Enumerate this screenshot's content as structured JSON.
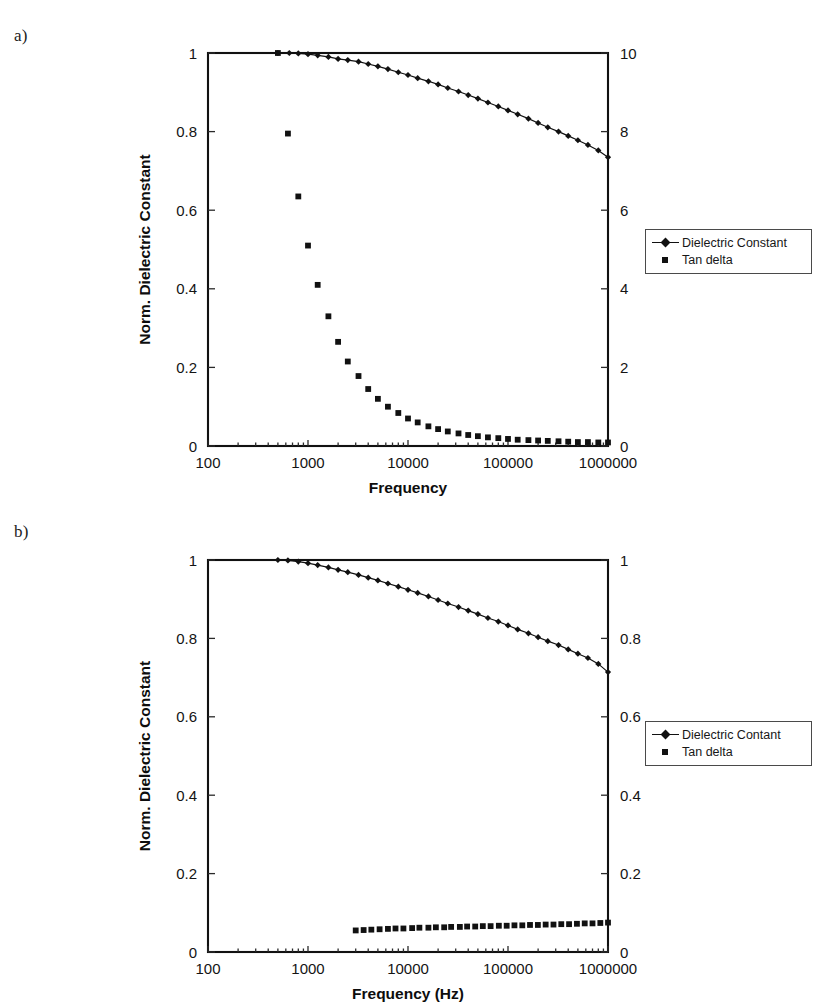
{
  "figure": {
    "panels": [
      {
        "id": "a",
        "label": "a)",
        "left_axis_title": "Norm. Dielectric Constant",
        "x_axis_title": "Frequency",
        "left_ticks": [
          "0",
          "0.2",
          "0.4",
          "0.6",
          "0.8",
          "1"
        ],
        "right_ticks": [
          "0",
          "2",
          "4",
          "6",
          "8",
          "10"
        ],
        "x_ticks": [
          "100",
          "1000",
          "10000",
          "100000",
          "1000000"
        ],
        "legend": [
          {
            "label": "Dielectric Constant",
            "marker": "diamond-line-icon"
          },
          {
            "label": "Tan delta",
            "marker": "square-icon"
          }
        ]
      },
      {
        "id": "b",
        "label": "b)",
        "left_axis_title": "Norm. Dielectric Constant",
        "x_axis_title": "Frequency (Hz)",
        "left_ticks": [
          "0",
          "0.2",
          "0.4",
          "0.6",
          "0.8",
          "1"
        ],
        "right_ticks": [
          "0",
          "0.2",
          "0.4",
          "0.6",
          "0.8",
          "1"
        ],
        "x_ticks": [
          "100",
          "1000",
          "10000",
          "100000",
          "1000000"
        ],
        "legend": [
          {
            "label": "Dielectric Contant",
            "marker": "diamond-line-icon"
          },
          {
            "label": "Tan delta",
            "marker": "square-icon"
          }
        ]
      }
    ]
  },
  "chart_data": [
    {
      "type": "line",
      "panel": "a",
      "title": "",
      "xlabel": "Frequency",
      "ylabel": "Norm. Dielectric Constant",
      "y2label": "",
      "xscale": "log",
      "xlim": [
        100,
        1000000
      ],
      "ylim": [
        0,
        1
      ],
      "y2lim": [
        0,
        10
      ],
      "xticks": [
        100,
        1000,
        10000,
        100000,
        1000000
      ],
      "yticks": [
        0,
        0.2,
        0.4,
        0.6,
        0.8,
        1
      ],
      "y2ticks": [
        0,
        2,
        4,
        6,
        8,
        10
      ],
      "grid": false,
      "legend_position": "outside-right",
      "series": [
        {
          "name": "Dielectric Constant",
          "axis": "left",
          "marker": "diamond",
          "line": true,
          "x": [
            500,
            650,
            800,
            1000,
            1250,
            1600,
            2000,
            2500,
            3200,
            4000,
            5000,
            6300,
            8000,
            10000,
            12500,
            16000,
            20000,
            25000,
            32000,
            40000,
            50000,
            63000,
            80000,
            100000,
            125000,
            160000,
            200000,
            250000,
            320000,
            400000,
            500000,
            630000,
            800000,
            1000000
          ],
          "y": [
            1.0,
            1.0,
            0.999,
            0.997,
            0.994,
            0.99,
            0.985,
            0.982,
            0.978,
            0.972,
            0.966,
            0.959,
            0.951,
            0.944,
            0.936,
            0.928,
            0.92,
            0.911,
            0.902,
            0.893,
            0.884,
            0.874,
            0.864,
            0.854,
            0.844,
            0.833,
            0.822,
            0.811,
            0.8,
            0.789,
            0.778,
            0.766,
            0.752,
            0.735
          ]
        },
        {
          "name": "Tan delta",
          "axis": "right",
          "marker": "square",
          "line": false,
          "x": [
            500,
            630,
            800,
            1000,
            1250,
            1600,
            2000,
            2500,
            3200,
            4000,
            5000,
            6300,
            8000,
            10000,
            12500,
            16000,
            20000,
            25000,
            32000,
            40000,
            50000,
            63000,
            80000,
            100000,
            125000,
            160000,
            200000,
            250000,
            320000,
            400000,
            500000,
            630000,
            800000,
            1000000
          ],
          "y": [
            10.0,
            7.95,
            6.35,
            5.1,
            4.1,
            3.3,
            2.65,
            2.15,
            1.78,
            1.45,
            1.2,
            1.0,
            0.84,
            0.7,
            0.6,
            0.5,
            0.43,
            0.37,
            0.32,
            0.28,
            0.25,
            0.22,
            0.2,
            0.18,
            0.16,
            0.15,
            0.14,
            0.13,
            0.12,
            0.11,
            0.1,
            0.1,
            0.09,
            0.09
          ]
        }
      ]
    },
    {
      "type": "line",
      "panel": "b",
      "title": "",
      "xlabel": "Frequency (Hz)",
      "ylabel": "Norm. Dielectric Constant",
      "y2label": "",
      "xscale": "log",
      "xlim": [
        100,
        1000000
      ],
      "ylim": [
        0,
        1
      ],
      "y2lim": [
        0,
        1
      ],
      "xticks": [
        100,
        1000,
        10000,
        100000,
        1000000
      ],
      "yticks": [
        0,
        0.2,
        0.4,
        0.6,
        0.8,
        1
      ],
      "y2ticks": [
        0,
        0.2,
        0.4,
        0.6,
        0.8,
        1
      ],
      "grid": false,
      "legend_position": "outside-right",
      "series": [
        {
          "name": "Dielectric Contant",
          "axis": "left",
          "marker": "diamond",
          "line": true,
          "x": [
            500,
            630,
            800,
            1000,
            1250,
            1600,
            2000,
            2500,
            3200,
            4000,
            5000,
            6300,
            8000,
            10000,
            12500,
            16000,
            20000,
            25000,
            32000,
            40000,
            50000,
            63000,
            80000,
            100000,
            125000,
            160000,
            200000,
            250000,
            320000,
            400000,
            500000,
            630000,
            800000,
            1000000
          ],
          "y": [
            1.0,
            0.999,
            0.996,
            0.992,
            0.987,
            0.981,
            0.975,
            0.969,
            0.962,
            0.955,
            0.948,
            0.94,
            0.932,
            0.924,
            0.916,
            0.907,
            0.898,
            0.889,
            0.88,
            0.871,
            0.862,
            0.852,
            0.843,
            0.833,
            0.823,
            0.813,
            0.803,
            0.793,
            0.783,
            0.772,
            0.761,
            0.75,
            0.735,
            0.714
          ]
        },
        {
          "name": "Tan delta",
          "axis": "right",
          "marker": "square",
          "line": false,
          "x": [
            3000,
            3600,
            4300,
            5200,
            6300,
            7500,
            9000,
            11000,
            13000,
            16000,
            19000,
            23000,
            27000,
            33000,
            39000,
            47000,
            56000,
            67000,
            81000,
            97000,
            116000,
            139000,
            166000,
            199000,
            238000,
            285000,
            341000,
            408000,
            489000,
            585000,
            700000,
            838000,
            1000000
          ],
          "y": [
            0.055,
            0.056,
            0.057,
            0.058,
            0.059,
            0.06,
            0.06,
            0.061,
            0.062,
            0.062,
            0.063,
            0.063,
            0.064,
            0.064,
            0.065,
            0.065,
            0.066,
            0.066,
            0.067,
            0.067,
            0.068,
            0.068,
            0.069,
            0.069,
            0.07,
            0.07,
            0.071,
            0.071,
            0.072,
            0.073,
            0.073,
            0.074,
            0.075
          ]
        }
      ]
    }
  ]
}
